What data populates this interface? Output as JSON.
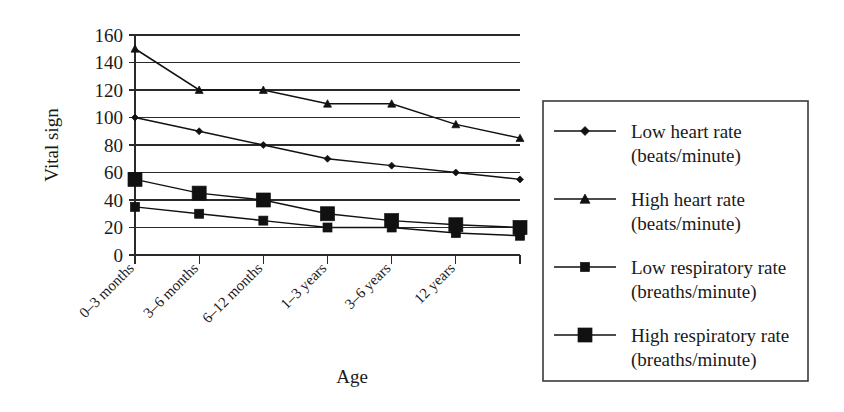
{
  "chart_data": {
    "type": "line",
    "title": "",
    "xlabel": "Age",
    "ylabel": "Vital sign",
    "ylim": [
      0,
      160
    ],
    "ytick_step": 20,
    "yticks": [
      0,
      20,
      40,
      60,
      80,
      100,
      120,
      140,
      160
    ],
    "grid": true,
    "legend_position": "right",
    "categories": [
      "0–3 months",
      "3–6 months",
      "6–12 months",
      "1–3 years",
      "3–6 years",
      "12 years",
      ""
    ],
    "x_tick_count": 7,
    "series": [
      {
        "name": "Low heart rate",
        "units": "(beats/minute)",
        "marker": "diamond",
        "marker_size": 7,
        "values": [
          100,
          90,
          80,
          70,
          65,
          60,
          55
        ]
      },
      {
        "name": "High heart rate",
        "units": "(beats/minute)",
        "marker": "triangle",
        "marker_size": 8,
        "values": [
          150,
          120,
          120,
          110,
          110,
          95,
          85
        ]
      },
      {
        "name": "Low respiratory rate",
        "units": "(breaths/minute)",
        "marker": "square-small",
        "marker_size": 9,
        "values": [
          35,
          30,
          25,
          20,
          20,
          16,
          14
        ]
      },
      {
        "name": "High respiratory rate",
        "units": "(breaths/minute)",
        "marker": "square-large",
        "marker_size": 14,
        "values": [
          55,
          45,
          40,
          30,
          25,
          22,
          20
        ]
      }
    ],
    "colors": {
      "line": "#111111",
      "marker": "#111111",
      "grid": "#2a2a2a",
      "axis": "#2a2a2a",
      "text": "#1a1a1a",
      "background": "#ffffff",
      "legend_border": "#3a3a3a"
    }
  },
  "legend": {
    "entries": [
      {
        "label": "Low heart rate",
        "sublabel": "(beats/minute)",
        "marker": "diamond"
      },
      {
        "label": "High heart rate",
        "sublabel": "(beats/minute)",
        "marker": "triangle"
      },
      {
        "label": "Low respiratory rate",
        "sublabel": "(breaths/minute)",
        "marker": "square-small"
      },
      {
        "label": "High respiratory rate",
        "sublabel": "(breaths/minute)",
        "marker": "square-large"
      }
    ]
  }
}
